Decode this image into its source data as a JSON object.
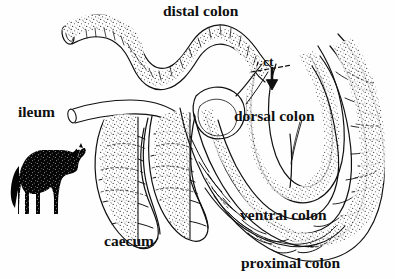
{
  "figure": {
    "background_color": "#fefefe",
    "ink_color": "#101010"
  },
  "labels": {
    "distal_colon": "distal colon",
    "ileum": "ileum",
    "ct": "ct",
    "dorsal_colon": "dorsal colon",
    "ventral_colon": "ventral colon",
    "caecum": "caecum",
    "proximal_colon": "proximal colon"
  },
  "icons": {
    "horse": "horse-silhouette-icon",
    "arrow": "down-arrow-icon"
  },
  "structures": [
    {
      "name": "distal-colon",
      "description": "narrow coiled tube, upper left, cut open end"
    },
    {
      "name": "ileum",
      "description": "small narrow tube entering from left"
    },
    {
      "name": "caecum",
      "description": "large sacculated blind pouch, lower left"
    },
    {
      "name": "proximal-colon",
      "description": "wide sacculated loop along bottom and right"
    },
    {
      "name": "ventral-colon",
      "description": "sacculated band above proximal colon"
    },
    {
      "name": "dorsal-colon",
      "description": "smooth wide loop, right centre"
    },
    {
      "name": "ct",
      "description": "colic transition marker with dashed line and arrow"
    }
  ]
}
